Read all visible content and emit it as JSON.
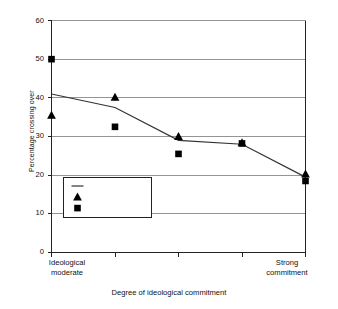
{
  "chart_data": {
    "type": "scatter",
    "title": "",
    "xlabel": "Degree of ideological commitment",
    "ylabel": "Percentage crossing over",
    "ylim": [
      0,
      60
    ],
    "yticks": [
      0,
      10,
      20,
      30,
      40,
      50,
      60
    ],
    "ytick_labels": [
      "0",
      "10",
      "20",
      "30",
      "40",
      "50",
      "60"
    ],
    "grid": "horizontal",
    "legend_position": "lower-left-inside",
    "x": [
      1,
      2,
      3,
      4,
      5
    ],
    "categories": [
      "Ideological moderate",
      "",
      "",
      "",
      "Strong commitment"
    ],
    "xtick_labels_left": "Ideological\nmoderate",
    "xtick_labels_right": "Strong\ncommitment",
    "xcat_left_line1": "Ideological",
    "xcat_left_line2": "moderate",
    "xcat_right_line1": "Strong",
    "xcat_right_line2": "commitment",
    "series": [
      {
        "name": "Overall",
        "marker": "line",
        "style": "line",
        "values": [
          41.0,
          37.5,
          29.0,
          28.0,
          19.5
        ],
        "color": "#333333"
      },
      {
        "name": "Democrats",
        "marker": "triangle",
        "style": "scatter",
        "values": [
          35.5,
          40.2,
          30.0,
          28.4,
          20.3
        ],
        "color": "#000000"
      },
      {
        "name": "Republicans",
        "marker": "square",
        "style": "scatter",
        "values": [
          50.0,
          32.5,
          25.5,
          28.2,
          18.5
        ],
        "color": "#000000"
      }
    ],
    "legend_entries": [
      {
        "label": "Overall",
        "marker": "line"
      },
      {
        "label": "Democrats",
        "marker": "triangle"
      },
      {
        "label": "Republicans",
        "marker": "square"
      }
    ],
    "axis_color": "#222222",
    "grid_color": "#888888",
    "background": "#ffffff"
  }
}
